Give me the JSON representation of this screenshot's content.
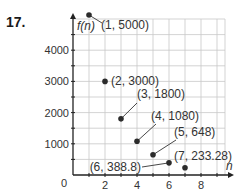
{
  "problem": {
    "number": "17."
  },
  "chart_data": {
    "type": "scatter",
    "title": "",
    "xlabel": "n",
    "ylabel": "f(n)",
    "xlim": [
      0,
      9.5
    ],
    "ylim": [
      0,
      4800
    ],
    "grid": true,
    "x_ticks": [
      "2",
      "4",
      "6",
      "8"
    ],
    "y_ticks": [
      "0",
      "1000",
      "2000",
      "3000",
      "4000"
    ],
    "points": [
      {
        "x": 1,
        "y": 5000,
        "label": "(1, 5000)"
      },
      {
        "x": 2,
        "y": 3000,
        "label": "(2, 3000)"
      },
      {
        "x": 3,
        "y": 1800,
        "label": "(3, 1800)"
      },
      {
        "x": 4,
        "y": 1080,
        "label": "(4, 1080)"
      },
      {
        "x": 5,
        "y": 648,
        "label": "(5, 648)"
      },
      {
        "x": 6,
        "y": 388.8,
        "label": "(6, 388.8)"
      },
      {
        "x": 7,
        "y": 233.28,
        "label": "(7, 233.28)"
      }
    ]
  }
}
